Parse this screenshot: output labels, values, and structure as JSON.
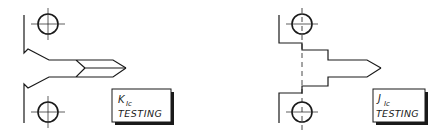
{
  "figure": {
    "panels": [
      {
        "id": "kic",
        "label_symbol": "K",
        "label_subscript": "Ic",
        "label_text": "TESTING",
        "specimen_type": "chevron-notch"
      },
      {
        "id": "jic",
        "label_symbol": "J",
        "label_subscript": "Ic",
        "label_text": "TESTING",
        "specimen_type": "stepped-notch"
      }
    ],
    "colors": {
      "line": "#1a1a1a",
      "background": "#ffffff",
      "shadow": "#1a1a1a"
    }
  }
}
